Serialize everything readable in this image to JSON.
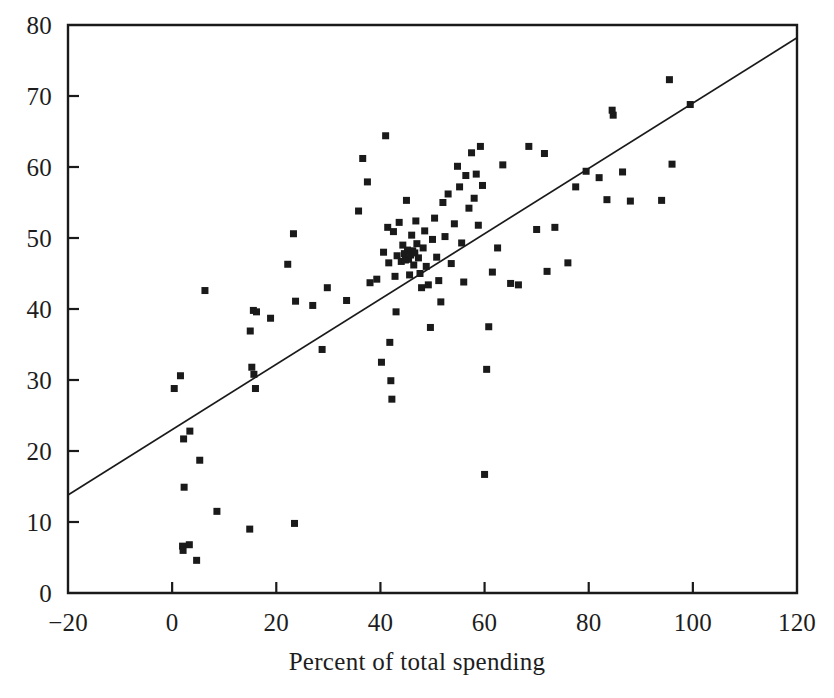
{
  "chart_data": {
    "type": "scatter",
    "title": "",
    "subtitle": "",
    "xlabel": "Percent of total spending",
    "ylabel": "",
    "xlim": [
      -20,
      120
    ],
    "ylim": [
      0,
      80
    ],
    "xticks": [
      -20,
      0,
      20,
      40,
      60,
      80,
      100,
      120
    ],
    "yticks": [
      0,
      10,
      20,
      30,
      40,
      50,
      60,
      70,
      80
    ],
    "xtick_labels": [
      "−20",
      "0",
      "20",
      "40",
      "60",
      "80",
      "100",
      "120"
    ],
    "ytick_labels": [
      "0",
      "10",
      "20",
      "30",
      "40",
      "50",
      "60",
      "70",
      "80"
    ],
    "grid": false,
    "legend": null,
    "marker": {
      "shape": "square",
      "color": "#1a1a1a",
      "size_px": 7
    },
    "trendline": {
      "type": "linear-fit",
      "color": "#1a1a1a",
      "x_start": -20,
      "y_start": 13.8,
      "x_end": 120,
      "y_end": 78.2
    },
    "points": [
      [
        0.4,
        28.8
      ],
      [
        1.6,
        30.6
      ],
      [
        2.2,
        21.7
      ],
      [
        3.4,
        22.8
      ],
      [
        2.3,
        14.9
      ],
      [
        5.3,
        18.7
      ],
      [
        6.3,
        42.6
      ],
      [
        2.0,
        6.6
      ],
      [
        2.1,
        6.0
      ],
      [
        3.3,
        6.8
      ],
      [
        4.7,
        4.6
      ],
      [
        8.6,
        11.5
      ],
      [
        14.9,
        9.0
      ],
      [
        15.0,
        36.9
      ],
      [
        15.6,
        39.8
      ],
      [
        16.2,
        39.6
      ],
      [
        15.3,
        31.8
      ],
      [
        15.7,
        30.8
      ],
      [
        16.0,
        28.8
      ],
      [
        18.9,
        38.7
      ],
      [
        23.5,
        9.8
      ],
      [
        23.3,
        50.6
      ],
      [
        23.7,
        41.1
      ],
      [
        22.2,
        46.3
      ],
      [
        27.0,
        40.5
      ],
      [
        28.8,
        34.3
      ],
      [
        29.8,
        43.0
      ],
      [
        33.5,
        41.2
      ],
      [
        35.8,
        53.8
      ],
      [
        36.6,
        61.2
      ],
      [
        37.5,
        57.9
      ],
      [
        38.0,
        43.7
      ],
      [
        39.3,
        44.2
      ],
      [
        40.2,
        32.5
      ],
      [
        40.6,
        48.0
      ],
      [
        41.0,
        64.4
      ],
      [
        41.4,
        51.5
      ],
      [
        41.6,
        46.5
      ],
      [
        41.8,
        35.3
      ],
      [
        42.0,
        29.9
      ],
      [
        42.2,
        27.3
      ],
      [
        42.5,
        50.9
      ],
      [
        42.8,
        44.6
      ],
      [
        43.0,
        39.6
      ],
      [
        43.2,
        47.5
      ],
      [
        43.6,
        52.2
      ],
      [
        44.0,
        46.7
      ],
      [
        44.3,
        49.0
      ],
      [
        44.6,
        47.8
      ],
      [
        44.8,
        46.9
      ],
      [
        45.0,
        55.3
      ],
      [
        45.2,
        48.3
      ],
      [
        45.4,
        47.0
      ],
      [
        45.6,
        44.8
      ],
      [
        45.8,
        47.6
      ],
      [
        46.0,
        50.4
      ],
      [
        46.2,
        48.2
      ],
      [
        46.4,
        46.2
      ],
      [
        46.6,
        47.9
      ],
      [
        46.8,
        52.4
      ],
      [
        47.0,
        49.2
      ],
      [
        47.3,
        47.2
      ],
      [
        47.6,
        45.0
      ],
      [
        47.9,
        43.0
      ],
      [
        48.2,
        48.6
      ],
      [
        48.5,
        51.0
      ],
      [
        48.8,
        46.0
      ],
      [
        49.2,
        43.4
      ],
      [
        49.6,
        37.4
      ],
      [
        50.0,
        49.8
      ],
      [
        50.4,
        52.8
      ],
      [
        50.8,
        47.3
      ],
      [
        51.2,
        44.0
      ],
      [
        51.6,
        41.0
      ],
      [
        52.0,
        55.0
      ],
      [
        52.4,
        50.2
      ],
      [
        53.0,
        56.2
      ],
      [
        53.6,
        46.4
      ],
      [
        54.2,
        52.0
      ],
      [
        54.8,
        60.1
      ],
      [
        55.2,
        57.2
      ],
      [
        55.6,
        49.3
      ],
      [
        56.0,
        43.8
      ],
      [
        56.4,
        58.8
      ],
      [
        57.0,
        54.2
      ],
      [
        57.5,
        62.0
      ],
      [
        58.0,
        55.6
      ],
      [
        58.4,
        59.0
      ],
      [
        58.8,
        51.8
      ],
      [
        59.2,
        62.9
      ],
      [
        59.6,
        57.4
      ],
      [
        60.0,
        16.7
      ],
      [
        60.4,
        31.5
      ],
      [
        60.8,
        37.5
      ],
      [
        61.5,
        45.2
      ],
      [
        62.5,
        48.6
      ],
      [
        63.5,
        60.3
      ],
      [
        65.0,
        43.6
      ],
      [
        66.5,
        43.4
      ],
      [
        68.5,
        62.9
      ],
      [
        70.0,
        51.2
      ],
      [
        71.5,
        61.9
      ],
      [
        72.0,
        45.3
      ],
      [
        73.5,
        51.5
      ],
      [
        76.0,
        46.5
      ],
      [
        77.5,
        57.2
      ],
      [
        79.5,
        59.4
      ],
      [
        82.0,
        58.5
      ],
      [
        83.5,
        55.4
      ],
      [
        84.5,
        68.0
      ],
      [
        84.7,
        67.3
      ],
      [
        86.5,
        59.3
      ],
      [
        88.0,
        55.2
      ],
      [
        94.0,
        55.3
      ],
      [
        95.5,
        72.3
      ],
      [
        96.0,
        60.4
      ],
      [
        99.5,
        68.8
      ]
    ]
  },
  "axes": {
    "frame_color": "#1a1a1a",
    "x_axis_name": "x-axis",
    "y_axis_name": "y-axis"
  }
}
